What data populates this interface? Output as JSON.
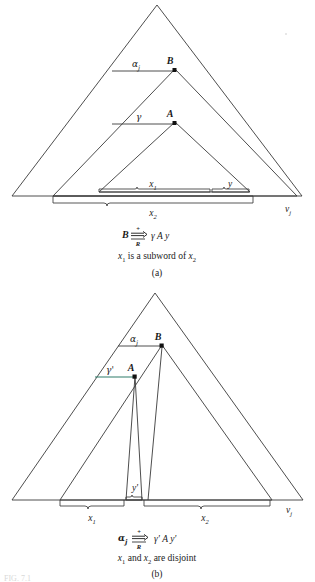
{
  "figure": {
    "id_label": "FIG. 7.1",
    "stroke_color": "#3a3a3a",
    "accent_color": "#2e7d6b",
    "background": "#ffffff"
  },
  "panel_a": {
    "key": "a",
    "panel_label": "(a)",
    "caption_parts": {
      "x1": "x",
      "x1_sub": "1",
      "mid": " is a subword of ",
      "x2": "x",
      "x2_sub": "2"
    },
    "caption_plain": "x1 is a subword of x2",
    "derivation": {
      "left": "B",
      "arrow_top": "+",
      "arrow_bottom": "R",
      "arrow_glyph": "⇒",
      "right": "γ A y"
    },
    "node_labels": [
      {
        "name": "B",
        "text": "B"
      },
      {
        "name": "A",
        "text": "A"
      }
    ],
    "edge_labels": [
      {
        "name": "alpha-j",
        "text": "α",
        "sub": "j"
      },
      {
        "name": "gamma",
        "text": "γ",
        "sub": ""
      }
    ],
    "brace_labels": [
      {
        "name": "x1",
        "text": "x",
        "sub": "1"
      },
      {
        "name": "y",
        "text": "y",
        "sub": ""
      },
      {
        "name": "x2",
        "text": "x",
        "sub": "2"
      }
    ],
    "baseline_label": {
      "name": "v-j",
      "text": "v",
      "sub": "j"
    }
  },
  "panel_b": {
    "key": "b",
    "panel_label": "(b)",
    "caption_parts": {
      "x1": "x",
      "x1_sub": "1",
      "mid": " and ",
      "x2": "x",
      "x2_sub": "2",
      "tail": " are disjoint"
    },
    "caption_plain": "x1 and x2 are disjoint",
    "derivation": {
      "left": "α",
      "left_sub": "j",
      "arrow_top": "+",
      "arrow_bottom": "R",
      "arrow_glyph": "⇒",
      "right": "γ' A y'"
    },
    "node_labels": [
      {
        "name": "B",
        "text": "B"
      },
      {
        "name": "A",
        "text": "A"
      }
    ],
    "edge_labels": [
      {
        "name": "alpha-j",
        "text": "α",
        "sub": "j"
      },
      {
        "name": "gamma-prime",
        "text": "γ'",
        "sub": ""
      }
    ],
    "brace_labels": [
      {
        "name": "x1",
        "text": "x",
        "sub": "1"
      },
      {
        "name": "y-prime",
        "text": "y'",
        "sub": ""
      },
      {
        "name": "x2",
        "text": "x",
        "sub": "2"
      }
    ],
    "baseline_label": {
      "name": "v-j",
      "text": "v",
      "sub": "j"
    }
  }
}
